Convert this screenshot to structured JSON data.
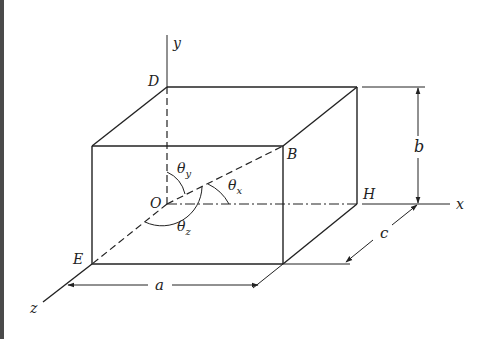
{
  "diagram": {
    "type": "3D rectangular box with coordinate axes and direction angles",
    "axes": {
      "x": "x",
      "y": "y",
      "z": "z"
    },
    "points": {
      "D": "D",
      "B": "B",
      "O": "O",
      "H": "H",
      "E": "E"
    },
    "dimensions": {
      "a": "a",
      "b": "b",
      "c": "c"
    },
    "angles": {
      "theta_x": {
        "base": "θ",
        "sub": "x"
      },
      "theta_y": {
        "base": "θ",
        "sub": "y"
      },
      "theta_z": {
        "base": "θ",
        "sub": "z"
      }
    },
    "colors": {
      "ink": "#222222",
      "background": "#ffffff",
      "edge_strip": "#4a4a4a"
    }
  }
}
